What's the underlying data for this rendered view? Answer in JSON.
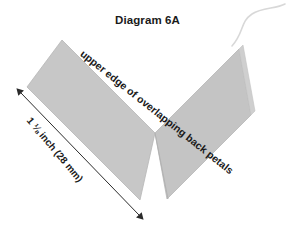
{
  "figure": {
    "title": "Diagram 6A",
    "edge_label": "upper edge of overlapping back petals",
    "measure_label": "1 ⅛ inch (28 mm)",
    "measure_value_inch": "1 1/8",
    "measure_value_mm": "28 mm"
  },
  "colors": {
    "background": "#ffffff",
    "petal_fill": "#c4c4c4",
    "petal_fill_light": "#cdcdcd",
    "petal_stroke": "#b0b0b0",
    "fold_line": "#b4b4b4",
    "thread": "#d8d8d8",
    "arrow": "#2b2b2b",
    "text": "#1a1a1a"
  },
  "shapes": {
    "petal_left": {
      "name": "left-petal-band",
      "points": "62,40 155,133 140,200 27,87"
    },
    "petal_right": {
      "name": "right-petal-band",
      "points": "155,133 239,49 251,115 167,199"
    },
    "petal_right_top": {
      "name": "right-petal-top-wedge",
      "points": "239,49 251,115 255,111 243,45"
    },
    "fold_line": {
      "name": "center-fold-line",
      "x1": 155,
      "y1": 133,
      "x2": 168,
      "y2": 199
    },
    "thread": {
      "name": "thread-curve",
      "path": "M 232,46 C 244,33 240,22 252,14 C 262,7 276,9 285,4"
    },
    "dimension_arrow": {
      "name": "dimension-arrow",
      "x1": 21,
      "y1": 93,
      "x2": 139,
      "y2": 215
    }
  },
  "icons": {
    "arrow_head_start": "arrow-head-up-left-icon",
    "arrow_head_end": "arrow-head-down-right-icon"
  }
}
